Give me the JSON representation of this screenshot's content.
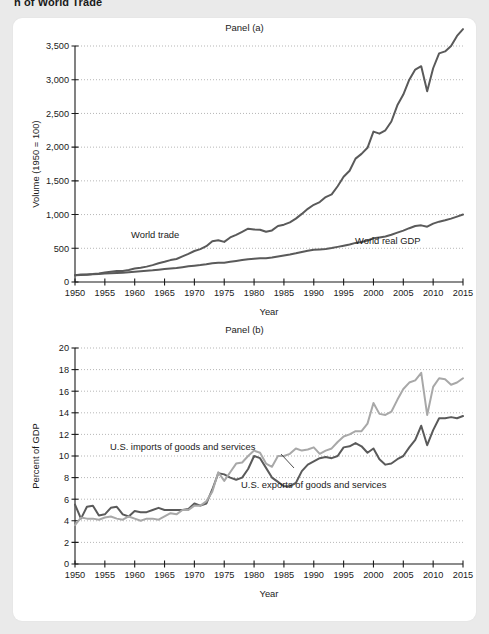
{
  "figure": {
    "title": "h of World Trade",
    "background_color": "#eaeaea",
    "card_color": "#ffffff"
  },
  "panel_a": {
    "title": "Panel (a)",
    "xlabel": "Year",
    "ylabel": "Volume (1950 = 100)"
  },
  "panel_b": {
    "title": "Panel (b)",
    "xlabel": "Year",
    "ylabel": "Percent of GDP"
  },
  "labels": {
    "world_trade": "World trade",
    "world_real_gdp": "World real GDP",
    "us_imports": "U.S. imports of goods and services",
    "us_exports": "U.S. exports of goods and services"
  },
  "colors": {
    "dark_line": "#5a5a5a",
    "light_line": "#a8a8a8",
    "axis": "#1a1a1a",
    "grid": "#9a9a9a"
  },
  "chart_data": [
    {
      "type": "line",
      "title": "Panel (a)",
      "xlabel": "Year",
      "ylabel": "Volume (1950 = 100)",
      "xlim": [
        1950,
        2015
      ],
      "ylim": [
        0,
        3500
      ],
      "yticks": [
        0,
        500,
        1000,
        1500,
        2000,
        2500,
        3000,
        3500
      ],
      "ytick_labels": [
        "0",
        "500",
        "1,000",
        "1,500",
        "2,000",
        "2,500",
        "3,000",
        "3,500"
      ],
      "xticks": [
        1950,
        1955,
        1960,
        1965,
        1970,
        1975,
        1980,
        1985,
        1990,
        1995,
        2000,
        2005,
        2010,
        2015
      ],
      "grid": "horizontal-dotted",
      "legend": "inline-annotations",
      "x": [
        1950,
        1951,
        1952,
        1953,
        1954,
        1955,
        1956,
        1957,
        1958,
        1959,
        1960,
        1961,
        1962,
        1963,
        1964,
        1965,
        1966,
        1967,
        1968,
        1969,
        1970,
        1971,
        1972,
        1973,
        1974,
        1975,
        1976,
        1977,
        1978,
        1979,
        1980,
        1981,
        1982,
        1983,
        1984,
        1985,
        1986,
        1987,
        1988,
        1989,
        1990,
        1991,
        1992,
        1993,
        1994,
        1995,
        1996,
        1997,
        1998,
        1999,
        2000,
        2001,
        2002,
        2003,
        2004,
        2005,
        2006,
        2007,
        2008,
        2009,
        2010,
        2011,
        2012,
        2013,
        2014,
        2015
      ],
      "series": [
        {
          "name": "World trade",
          "color": "#5a5a5a",
          "values": [
            100,
            112,
            112,
            118,
            128,
            140,
            153,
            164,
            163,
            179,
            200,
            213,
            228,
            250,
            278,
            300,
            325,
            341,
            379,
            417,
            460,
            488,
            531,
            605,
            620,
            595,
            661,
            700,
            745,
            790,
            780,
            775,
            745,
            765,
            830,
            850,
            885,
            940,
            1010,
            1085,
            1145,
            1185,
            1260,
            1300,
            1420,
            1560,
            1650,
            1830,
            1900,
            1990,
            2230,
            2200,
            2250,
            2380,
            2620,
            2780,
            3000,
            3150,
            3200,
            2830,
            3170,
            3390,
            3420,
            3500,
            3650,
            3750
          ]
        },
        {
          "name": "World real GDP",
          "color": "#5a5a5a",
          "values": [
            100,
            105,
            109,
            114,
            118,
            125,
            130,
            135,
            139,
            146,
            153,
            159,
            166,
            173,
            183,
            192,
            201,
            209,
            220,
            232,
            242,
            251,
            262,
            277,
            285,
            287,
            300,
            312,
            325,
            338,
            345,
            351,
            352,
            362,
            379,
            394,
            408,
            425,
            445,
            463,
            477,
            483,
            491,
            503,
            521,
            539,
            557,
            580,
            592,
            615,
            648,
            661,
            675,
            700,
            732,
            762,
            798,
            830,
            840,
            820,
            865,
            895,
            915,
            940,
            970,
            1000
          ]
        }
      ]
    },
    {
      "type": "line",
      "title": "Panel (b)",
      "xlabel": "Year",
      "ylabel": "Percent of GDP",
      "xlim": [
        1950,
        2015
      ],
      "ylim": [
        0,
        20
      ],
      "yticks": [
        0,
        2,
        4,
        6,
        8,
        10,
        12,
        14,
        16,
        18,
        20
      ],
      "ytick_labels": [
        "0",
        "2",
        "4",
        "6",
        "8",
        "10",
        "12",
        "14",
        "16",
        "18",
        "20"
      ],
      "xticks": [
        1950,
        1955,
        1960,
        1965,
        1970,
        1975,
        1980,
        1985,
        1990,
        1995,
        2000,
        2005,
        2010,
        2015
      ],
      "grid": "horizontal-dotted",
      "legend": "inline-annotations",
      "x": [
        1950,
        1951,
        1952,
        1953,
        1954,
        1955,
        1956,
        1957,
        1958,
        1959,
        1960,
        1961,
        1962,
        1963,
        1964,
        1965,
        1966,
        1967,
        1968,
        1969,
        1970,
        1971,
        1972,
        1973,
        1974,
        1975,
        1976,
        1977,
        1978,
        1979,
        1980,
        1981,
        1982,
        1983,
        1984,
        1985,
        1986,
        1987,
        1988,
        1989,
        1990,
        1991,
        1992,
        1993,
        1994,
        1995,
        1996,
        1997,
        1998,
        1999,
        2000,
        2001,
        2002,
        2003,
        2004,
        2005,
        2006,
        2007,
        2008,
        2009,
        2010,
        2011,
        2012,
        2013,
        2014,
        2015
      ],
      "series": [
        {
          "name": "U.S. exports of goods and services",
          "color": "#5a5a5a",
          "values": [
            5.5,
            4.2,
            5.3,
            5.4,
            4.5,
            4.6,
            5.2,
            5.3,
            4.6,
            4.4,
            4.9,
            4.8,
            4.8,
            5.0,
            5.2,
            5.0,
            5.0,
            5.0,
            5.0,
            5.1,
            5.6,
            5.4,
            5.6,
            6.9,
            8.4,
            8.3,
            8.0,
            7.8,
            8.0,
            8.8,
            10.0,
            9.8,
            8.9,
            8.0,
            7.6,
            7.2,
            7.2,
            7.5,
            8.6,
            9.2,
            9.5,
            9.8,
            9.9,
            9.8,
            10.0,
            10.8,
            10.9,
            11.2,
            10.9,
            10.3,
            10.7,
            9.7,
            9.2,
            9.3,
            9.7,
            10.0,
            10.8,
            11.5,
            12.8,
            11.0,
            12.4,
            13.5,
            13.5,
            13.6,
            13.5,
            13.7
          ]
        },
        {
          "name": "U.S. imports of goods and services",
          "color": "#a8a8a8",
          "values": [
            3.6,
            4.3,
            4.2,
            4.2,
            4.1,
            4.3,
            4.4,
            4.2,
            4.1,
            4.4,
            4.2,
            4.0,
            4.2,
            4.2,
            4.1,
            4.4,
            4.7,
            4.6,
            5.0,
            5.0,
            5.4,
            5.4,
            5.8,
            6.7,
            8.5,
            7.7,
            8.5,
            9.3,
            9.4,
            10.0,
            10.5,
            10.3,
            9.3,
            9.0,
            10.0,
            10.0,
            10.2,
            10.7,
            10.5,
            10.6,
            10.8,
            10.2,
            10.5,
            10.7,
            11.3,
            11.8,
            12.0,
            12.3,
            12.3,
            13.0,
            14.9,
            13.9,
            13.8,
            14.1,
            15.2,
            16.2,
            16.8,
            17.0,
            17.7,
            13.8,
            16.4,
            17.2,
            17.1,
            16.6,
            16.8,
            17.2
          ]
        }
      ]
    }
  ]
}
